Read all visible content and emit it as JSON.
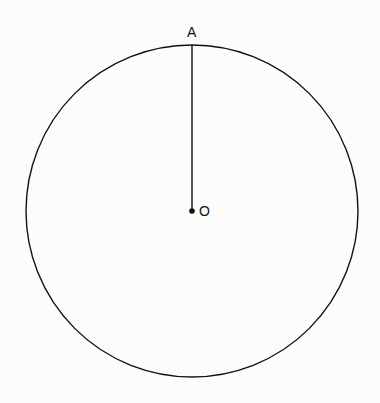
{
  "diagram": {
    "title": "",
    "circle": {
      "cx": 192,
      "cy": 211,
      "r": 166,
      "stroke": "#111111"
    },
    "center_point": {
      "label": "O",
      "x": 192,
      "y": 211
    },
    "radius_endpoint": {
      "label": "A",
      "x": 192,
      "y": 45
    },
    "segments": [
      {
        "from": "O",
        "to": "A"
      }
    ]
  }
}
